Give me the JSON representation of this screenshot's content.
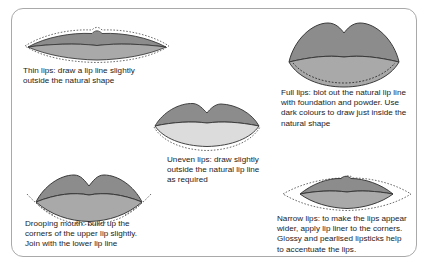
{
  "page": {
    "background_color": "#ffffff",
    "frame_color": "#a9a9a9"
  },
  "colors": {
    "upper_lip": "#8c8c8c",
    "lower_lip": "#a9a9a9",
    "lower_lip_light": "#e8e8e8",
    "outline": "#3a3a3a",
    "dashed_guide": "#6e6e6e",
    "text": "#1b1b1b"
  },
  "figures": [
    {
      "id": "thin-lips",
      "name": "Thin lips",
      "caption": "Thin lips: draw a lip line slightly\noutside the natural shape"
    },
    {
      "id": "full-lips",
      "name": "Full lips",
      "caption": "Full lips: blot out the natural lip line\nwith foundation and powder. Use\ndark colours to draw just inside the\nnatural shape"
    },
    {
      "id": "uneven-lips",
      "name": "Uneven lips",
      "caption": "Uneven lips: draw slightly\noutside the natural lip line\nas required"
    },
    {
      "id": "drooping-mouth",
      "name": "Drooping mouth",
      "caption": "Drooping mouth: build up the\ncorners of the upper lip slightly.\nJoin with the lower lip line"
    },
    {
      "id": "narrow-lips",
      "name": "Narrow lips",
      "caption": "Narrow lips: to make the lips appear\nwider, apply lip liner to the corners.\nGlossy and pearlised lipsticks help\nto accentuate the lips."
    }
  ]
}
